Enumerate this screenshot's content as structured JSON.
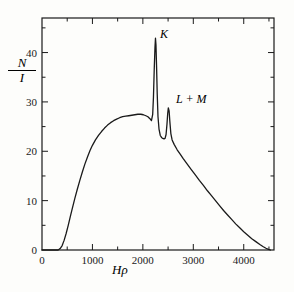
{
  "figure": {
    "y_axis_label_numerator": "N",
    "y_axis_label_denominator": "I",
    "x_axis_label": "Hρ",
    "background_color": "#fdfdfb",
    "line_color": "#1a1a1a"
  },
  "annotations": {
    "k_peak_label": "K",
    "lm_peak_label": "L + M"
  },
  "chart_data": {
    "type": "line",
    "title": "",
    "xlabel": "Hρ",
    "ylabel": "N/I",
    "xlim": [
      0,
      4600
    ],
    "ylim": [
      0,
      47
    ],
    "grid": false,
    "legend": null,
    "x_ticks_major": [
      0,
      1000,
      2000,
      3000,
      4000
    ],
    "x_ticklabels": [
      "0",
      "1000",
      "2000",
      "3000",
      "4000"
    ],
    "x_ticks_minor": [
      500,
      1500,
      2500,
      3500,
      4500
    ],
    "y_ticks_major": [
      0,
      10,
      20,
      30,
      40
    ],
    "y_ticklabels": [
      "0",
      "10",
      "20",
      "30",
      "40"
    ],
    "y_ticks_minor": [
      5,
      15,
      25,
      35,
      45
    ],
    "annotations": [
      {
        "text": "K",
        "x": 2280,
        "y": 43.5
      },
      {
        "text": "L + M",
        "x": 2620,
        "y": 30.0
      }
    ],
    "series": [
      {
        "name": "N/I spectrum",
        "x": [
          320,
          360,
          400,
          440,
          480,
          520,
          560,
          600,
          650,
          700,
          750,
          800,
          850,
          900,
          950,
          1000,
          1060,
          1120,
          1180,
          1240,
          1300,
          1360,
          1420,
          1480,
          1540,
          1600,
          1660,
          1720,
          1780,
          1840,
          1900,
          1960,
          2010,
          2060,
          2100,
          2140,
          2170,
          2195,
          2210,
          2225,
          2240,
          2250,
          2260,
          2272,
          2285,
          2300,
          2320,
          2345,
          2370,
          2395,
          2420,
          2440,
          2460,
          2478,
          2492,
          2505,
          2520,
          2535,
          2555,
          2580,
          2620,
          2680,
          2740,
          2800,
          2880,
          2960,
          3040,
          3120,
          3200,
          3280,
          3360,
          3440,
          3520,
          3600,
          3680,
          3760,
          3840,
          3920,
          4000,
          4080,
          4160,
          4240,
          4320,
          4380,
          4440,
          4490,
          4530
        ],
        "y": [
          0.0,
          0.3,
          0.9,
          2.0,
          3.4,
          5.0,
          6.7,
          8.4,
          10.4,
          12.3,
          14.1,
          15.8,
          17.4,
          18.8,
          20.1,
          21.2,
          22.3,
          23.2,
          24.0,
          24.7,
          25.3,
          25.8,
          26.2,
          26.5,
          26.8,
          27.0,
          27.1,
          27.2,
          27.3,
          27.4,
          27.5,
          27.5,
          27.4,
          27.2,
          27.0,
          26.6,
          26.2,
          27.5,
          31.0,
          36.5,
          41.0,
          42.9,
          41.5,
          37.0,
          31.5,
          27.0,
          24.5,
          23.2,
          22.8,
          22.6,
          22.5,
          22.6,
          23.4,
          25.5,
          27.6,
          28.8,
          28.2,
          26.0,
          23.6,
          22.3,
          21.4,
          20.3,
          19.4,
          18.5,
          17.4,
          16.3,
          15.2,
          14.1,
          13.1,
          12.0,
          11.0,
          10.0,
          9.0,
          8.0,
          7.1,
          6.2,
          5.3,
          4.5,
          3.7,
          3.0,
          2.3,
          1.7,
          1.1,
          0.7,
          0.35,
          0.12,
          0.0
        ]
      }
    ]
  }
}
